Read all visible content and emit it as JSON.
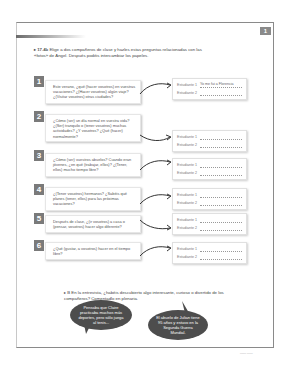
{
  "page": {
    "unit_tab": "1",
    "footer_text": "—— ——"
  },
  "activity1": {
    "bullet": "▸",
    "badge": "17.4b",
    "instruction": "Elige a dos compañeros de clase y hazles estas preguntas relacionadas con las «fotos» de Ángel. Después podéis intercambiar los papeles."
  },
  "questions": [
    {
      "number": "1",
      "text": "Este verano, ¿qué (hacer vosotros) en vuestras vacaciones? ¿(Hacer vosotros) algún viaje? ¿(Visitar vosotros) otras ciudades?",
      "answers": [
        {
          "label": "Estudiante 1",
          "value": "Yo me fui a Florencia"
        },
        {
          "label": "Estudiante 2",
          "value": ""
        }
      ]
    },
    {
      "number": "2",
      "text": "¿Cómo (ser) un día normal en vuestra vida? ¿(Ser) tranquilo o (tener vosotros) muchas actividades? ¿Y vosotros? ¿Qué (hacer) normalmente?",
      "answers": [
        {
          "label": "Estudiante 1",
          "value": ""
        },
        {
          "label": "Estudiante 2",
          "value": ""
        }
      ]
    },
    {
      "number": "3",
      "text": "¿Cómo (ser) vuestros abuelos? Cuando eran jóvenes, ¿en qué (trabajar, ellos)? ¿(Tener, ellos) mucho tiempo libre?",
      "answers": [
        {
          "label": "Estudiante 1",
          "value": ""
        },
        {
          "label": "Estudiante 2",
          "value": ""
        }
      ]
    },
    {
      "number": "4",
      "text": "¿(Tener vosotros) hermanos? ¿Sabéis qué planes (tener, ellos) para las próximas vacaciones?",
      "answers": [
        {
          "label": "Estudiante 1",
          "value": ""
        },
        {
          "label": "Estudiante 2",
          "value": ""
        }
      ]
    },
    {
      "number": "5",
      "text": "Después de clase, ¿(ir vosotros) a casa o (pensar, vosotros) hacer algo diferente?",
      "answers": [
        {
          "label": "Estudiante 1",
          "value": ""
        },
        {
          "label": "Estudiante 2",
          "value": ""
        }
      ]
    },
    {
      "number": "6",
      "text": "¿Qué (gustar, a vosotros) hacer en el tiempo libre?",
      "answers": [
        {
          "label": "Estudiante 1",
          "value": ""
        },
        {
          "label": "Estudiante 2",
          "value": ""
        }
      ]
    }
  ],
  "activity2": {
    "bullet": "▸",
    "badge": "B",
    "instruction": "En la entrevista, ¿habéis descubierto algo interesante, curioso o divertido de los compañeros? Comentadlo en plenaria."
  },
  "bubbles": [
    {
      "text": "Pensaba que Claire practicaba muchos más deportes, pero sólo juega al tenis..."
    },
    {
      "text": "El abuelo de Julian tiene 95 años y estuvo en la Segunda Guerra Mundial."
    }
  ]
}
